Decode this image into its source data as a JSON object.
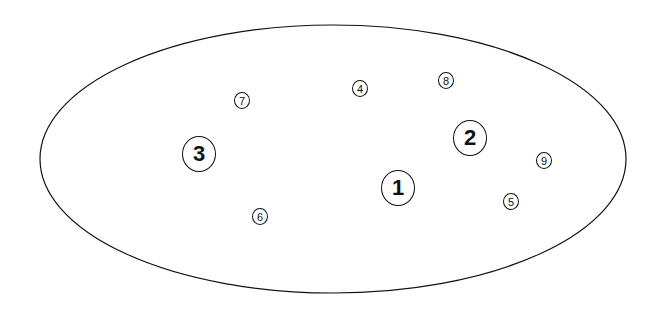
{
  "diagram": {
    "boundary": {
      "shape": "ellipse",
      "cx": 333,
      "cy": 159,
      "rx": 293,
      "ry": 134,
      "stroke": "#111111"
    },
    "nodes": [
      {
        "label": "1",
        "size": "large",
        "x": 398,
        "y": 188
      },
      {
        "label": "2",
        "size": "large",
        "x": 470,
        "y": 138
      },
      {
        "label": "3",
        "size": "large",
        "x": 199,
        "y": 154
      },
      {
        "label": "4",
        "size": "small",
        "x": 360,
        "y": 88
      },
      {
        "label": "5",
        "size": "small",
        "x": 511,
        "y": 201
      },
      {
        "label": "6",
        "size": "small",
        "x": 260,
        "y": 216
      },
      {
        "label": "7",
        "size": "small",
        "x": 242,
        "y": 100
      },
      {
        "label": "8",
        "size": "small",
        "x": 446,
        "y": 80
      },
      {
        "label": "9",
        "size": "small",
        "x": 544,
        "y": 160
      }
    ]
  }
}
